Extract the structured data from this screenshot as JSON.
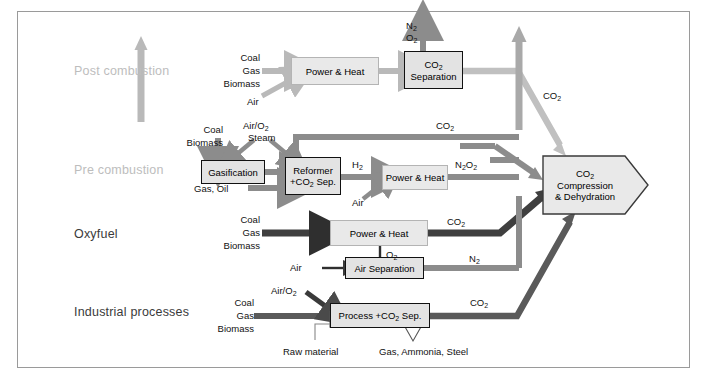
{
  "diagram": {
    "frame_color": "#9a9a9a",
    "colors": {
      "light_gray_flow": "#b9b9b9",
      "mid_gray_flow": "#8c8c8c",
      "dark_flow": "#4a4a4a",
      "black_flow": "#333333",
      "box_fill_light": "#e9e9e9",
      "box_fill_dark": "#e3e3e3",
      "label_faded": "#bdbdbd",
      "label_dark": "#3a3a3a"
    }
  },
  "rows": [
    {
      "id": "post",
      "label": "Post combustion",
      "style": "faded"
    },
    {
      "id": "pre",
      "label": "Pre combustion",
      "style": "faded"
    },
    {
      "id": "oxyfuel",
      "label": "Oxyfuel",
      "style": "dark"
    },
    {
      "id": "industrial",
      "label": "Industrial processes",
      "style": "dark"
    }
  ],
  "boxes": {
    "post_power_heat": {
      "label": "Power & Heat",
      "border": "thin"
    },
    "co2_separation_l1": "CO",
    "co2_separation_l1_sub": "2",
    "co2_separation_l2": "Separation",
    "gasification": {
      "label": "Gasification",
      "border": "thick"
    },
    "reformer_l1": "Reformer",
    "reformer_l2a": "+CO",
    "reformer_l2sub": "2",
    "reformer_l2b": " Sep.",
    "pre_power_heat": {
      "label": "Power & Heat",
      "border": "thin"
    },
    "oxy_power_heat": {
      "label": "Power & Heat",
      "border": "thin"
    },
    "air_separation": {
      "label": "Air Separation",
      "border": "thick"
    },
    "process_a": "Process +CO",
    "process_sub": "2",
    "process_b": " Sep.",
    "compression_l1a": "CO",
    "compression_l1sub": "2",
    "compression_l2": "Compression",
    "compression_l3": "& Dehydration"
  },
  "feeds": {
    "post_coal": "Coal",
    "post_gas": "Gas",
    "post_biomass": "Biomass",
    "post_air": "Air",
    "pre_coal": "Coal",
    "pre_biomass": "Biomass",
    "pre_airo2": "Air/O",
    "pre_airo2_sub": "2",
    "pre_steam": "Steam",
    "pre_gasoil": "Gas, Oil",
    "pre_air": "Air",
    "oxy_coal": "Coal",
    "oxy_gas": "Gas",
    "oxy_biomass": "Biomass",
    "oxy_air": "Air",
    "ind_coal": "Coal",
    "ind_gas": "Gas",
    "ind_biomass": "Biomass",
    "ind_airo2": "Air/O",
    "ind_airo2_sub": "2",
    "ind_raw_material": "Raw material",
    "ind_products": "Gas, Ammonia, Steel"
  },
  "stream_labels": {
    "n2_top": "N",
    "n2_top_sub": "2",
    "o2_top": "O",
    "o2_top_sub": "2",
    "co2_post_diag": "CO",
    "co2_post_diag_sub": "2",
    "co2_pre_top": "CO",
    "co2_pre_top_sub": "2",
    "h2_pre": "H",
    "h2_pre_sub": "2",
    "n2o2_pre_a": "N",
    "n2o2_pre_sub1": "2",
    "n2o2_pre_b": "O",
    "n2o2_pre_sub2": "2",
    "co2_oxy": "CO",
    "co2_oxy_sub": "2",
    "o2_oxy": "O",
    "o2_oxy_sub": "2",
    "n2_oxy": "N",
    "n2_oxy_sub": "2",
    "co2_ind": "CO",
    "co2_ind_sub": "2"
  }
}
